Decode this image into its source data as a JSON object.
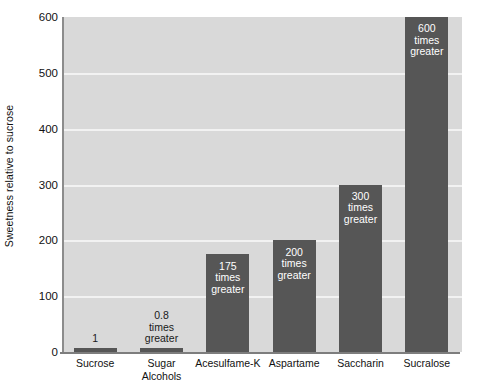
{
  "chart_data": {
    "type": "bar",
    "title": "",
    "xlabel": "",
    "ylabel": "Sweetness relative to sucrose",
    "ylim": [
      0,
      600
    ],
    "ytick_values": [
      0,
      100,
      200,
      300,
      400,
      500,
      600
    ],
    "ytick_labels": [
      "0",
      "100",
      "200",
      "300",
      "400",
      "500",
      "600"
    ],
    "grid": true,
    "legend": "none",
    "categories": [
      "Sucrose",
      "Sugar\nAlcohols",
      "Acesulfame-K",
      "Aspartame",
      "Saccharin",
      "Sucralose"
    ],
    "values": [
      1,
      0.8,
      175,
      200,
      300,
      600
    ],
    "bar_labels": [
      "1",
      "0.8\ntimes\ngreater",
      "175\ntimes\ngreater",
      "200\ntimes\ngreater",
      "300\ntimes\ngreater",
      "600\ntimes\ngreater"
    ],
    "bar_label_placement": [
      "above",
      "above",
      "inside",
      "inside",
      "inside",
      "inside"
    ],
    "colors": {
      "bar": "#565656",
      "plot_background": "#d9d9d9",
      "gridline": "#f2f2f2",
      "axis": "#7d7d7d",
      "label_inside": "#ffffff",
      "label_outside": "#1a1a1a",
      "page_background": "#ffffff"
    }
  }
}
